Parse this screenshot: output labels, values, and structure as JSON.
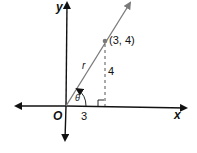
{
  "diagram": {
    "axes": {
      "x_label": "x",
      "y_label": "y",
      "origin_label": "O"
    },
    "point": {
      "label": "(3, 4)",
      "x": 3,
      "y": 4
    },
    "segments": {
      "hypotenuse_label": "r",
      "vertical_label": "4",
      "horizontal_label": "3"
    },
    "angle": {
      "label": "θ"
    },
    "colors": {
      "axis": "#111111",
      "ray": "#7a7a7a",
      "dashed": "#555555"
    }
  }
}
